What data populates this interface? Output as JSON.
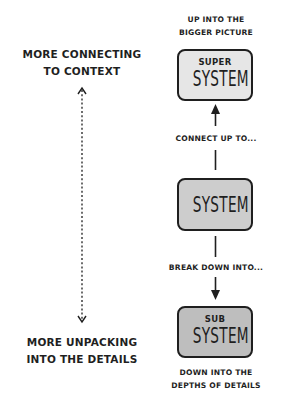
{
  "diagram": {
    "left_axis": {
      "top_label_lines": [
        "MORE CONNECTING",
        "TO CONTEXT"
      ],
      "bottom_label_lines": [
        "MORE UNPACKING",
        "INTO THE DETAILS"
      ],
      "style": "dotted bidirectional arrow"
    },
    "levels": [
      {
        "id": "super",
        "caption_lines": [
          "UP INTO THE",
          "BIGGER PICTURE"
        ],
        "small_text": "SUPER",
        "big_text": "SYSTEM",
        "fill": "#e6e6e6"
      },
      {
        "id": "system",
        "caption_lines": [],
        "small_text": "",
        "big_text": "SYSTEM",
        "fill": "#cdcdcd"
      },
      {
        "id": "sub",
        "caption_lines": [
          "DOWN INTO THE",
          "DEPTHS OF DETAILS"
        ],
        "small_text": "SUB",
        "big_text": "SYSTEM",
        "fill": "#bebebe"
      }
    ],
    "connectors": {
      "up_label": "CONNECT UP TO...",
      "down_label": "BREAK DOWN INTO..."
    },
    "colors": {
      "ink": "#1f1f1f",
      "background": "#ffffff"
    }
  }
}
